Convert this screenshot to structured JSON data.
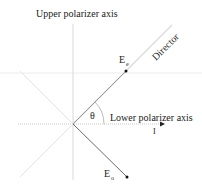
{
  "diagram": {
    "labels": {
      "upper_axis": "Upper polarizer axis",
      "lower_axis": "Lower polarizer axis",
      "director": "Director",
      "ee_main": "E",
      "ee_sub": "e",
      "eo_main": "E",
      "eo_sub": "o",
      "theta": "θ",
      "intensity_marker": "I"
    },
    "angle_theta_deg": 45,
    "colors": {
      "axis_line": "#d8d8d8",
      "director_line": "#e0e0e0",
      "vector": "#555555",
      "text": "#222222"
    }
  }
}
